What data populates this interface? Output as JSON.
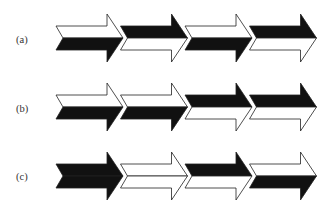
{
  "figure": {
    "colors": {
      "black": "#111111",
      "white": "#ffffff",
      "stroke": "#222222"
    },
    "rows": [
      {
        "label": "(a)",
        "segments": [
          {
            "top": "white",
            "bottom": "black"
          },
          {
            "top": "black",
            "bottom": "white"
          },
          {
            "top": "white",
            "bottom": "black"
          },
          {
            "top": "black",
            "bottom": "white"
          }
        ]
      },
      {
        "label": "(b)",
        "segments": [
          {
            "top": "white",
            "bottom": "black"
          },
          {
            "top": "white",
            "bottom": "black"
          },
          {
            "top": "black",
            "bottom": "white"
          },
          {
            "top": "black",
            "bottom": "white"
          }
        ]
      },
      {
        "label": "(c)",
        "segments": [
          {
            "top": "black",
            "bottom": "black"
          },
          {
            "top": "white",
            "bottom": "white"
          },
          {
            "top": "black",
            "bottom": "white"
          },
          {
            "top": "white",
            "bottom": "black"
          }
        ]
      }
    ]
  }
}
